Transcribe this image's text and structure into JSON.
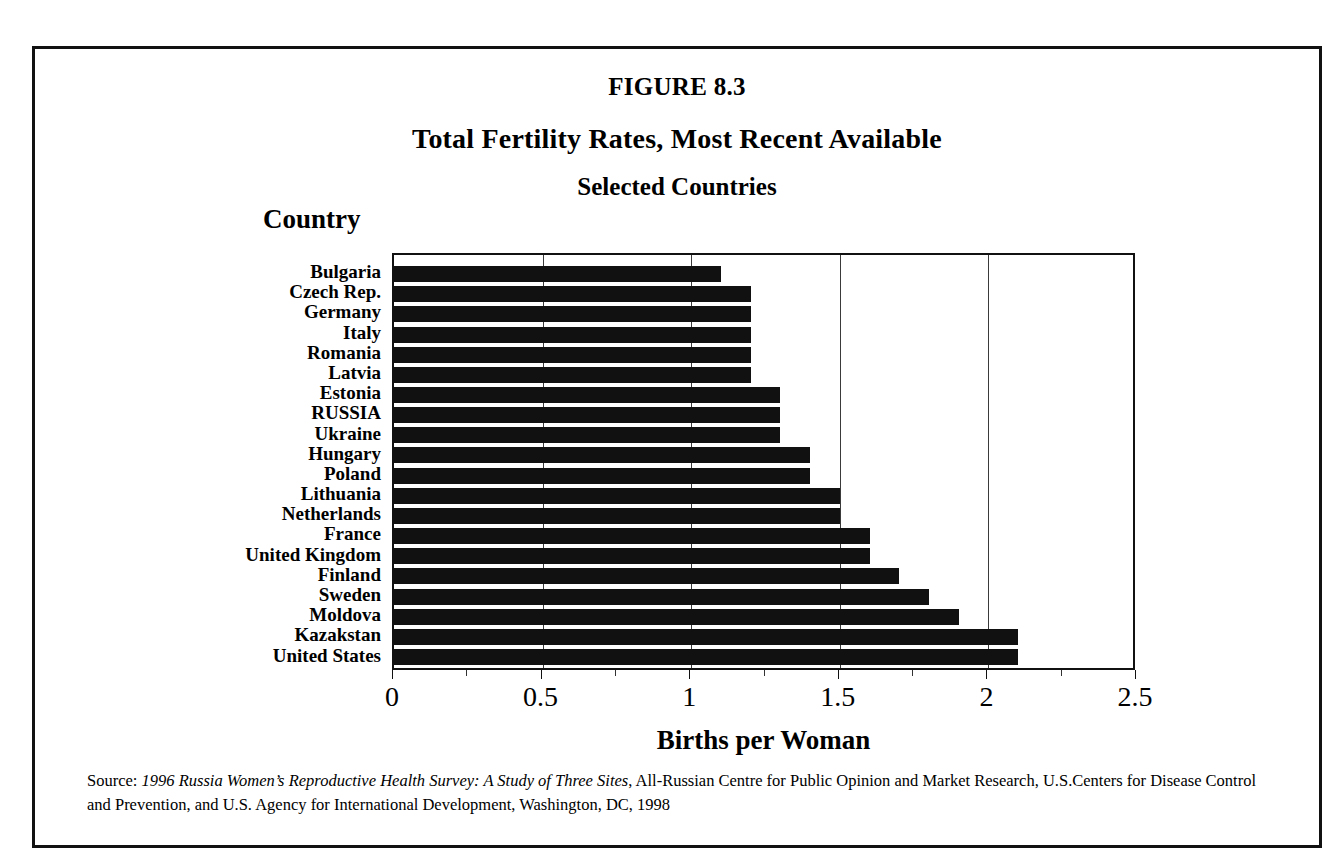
{
  "figure": {
    "number": "FIGURE 8.3",
    "title": "Total Fertility Rates, Most Recent Available",
    "subtitle": "Selected Countries",
    "category_axis_label": "Country",
    "value_axis_label": "Births per Woman"
  },
  "source": {
    "label": "Source: ",
    "title": "1996 Russia Women’s Reproductive Health Survey: A Study of Three Sites",
    "rest": ", All-Russian Centre for Public Opinion and Market Research, U.S.Centers for Disease Control and Prevention, and U.S. Agency for International Development, Washington, DC, 1998"
  },
  "axis": {
    "tick_labels": [
      "0",
      "0.5",
      "1",
      "1.5",
      "2",
      "2.5"
    ],
    "tick_values": [
      0,
      0.5,
      1,
      1.5,
      2,
      2.5
    ],
    "minor_tick_values": [
      0.25,
      0.75,
      1.25,
      1.75,
      2.25
    ],
    "gridline_values": [
      0.5,
      1,
      1.5,
      2
    ],
    "min": 0,
    "max": 2.5
  },
  "colors": {
    "bar": "#111111",
    "frame": "#111111",
    "grid": "#3a3a3a",
    "background": "#ffffff"
  },
  "chart_data": {
    "type": "bar",
    "orientation": "horizontal",
    "subtitle": "Selected Countries",
    "xlabel": "Births per Woman",
    "ylabel": "Country",
    "xlim": [
      0,
      2.5
    ],
    "grid": true,
    "legend": "none",
    "categories": [
      "Bulgaria",
      "Czech Rep.",
      "Germany",
      "Italy",
      "Romania",
      "Latvia",
      "Estonia",
      "RUSSIA",
      "Ukraine",
      "Hungary",
      "Poland",
      "Lithuania",
      "Netherlands",
      "France",
      "United Kingdom",
      "Finland",
      "Sweden",
      "Moldova",
      "Kazakstan",
      "United States"
    ],
    "values": [
      1.1,
      1.2,
      1.2,
      1.2,
      1.2,
      1.2,
      1.3,
      1.3,
      1.3,
      1.4,
      1.4,
      1.5,
      1.5,
      1.6,
      1.6,
      1.7,
      1.8,
      1.9,
      2.1,
      2.1
    ]
  }
}
